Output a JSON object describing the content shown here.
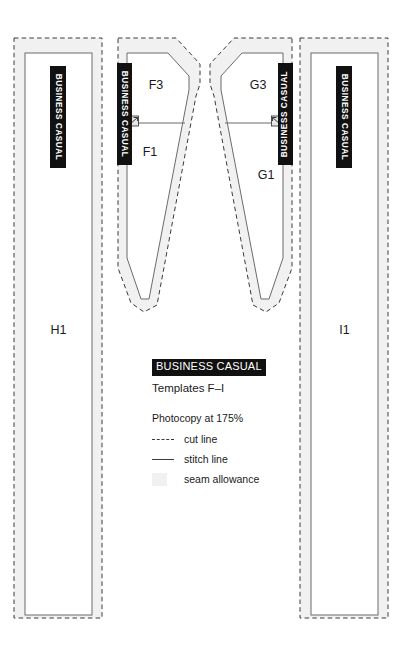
{
  "document": {
    "kind": "sewing-pattern-template-sheet",
    "brand_tag": "BUSINESS CASUAL"
  },
  "legend": {
    "title": "BUSINESS CASUAL",
    "subtitle": "Templates F–I",
    "scale_note": "Photocopy at 175%",
    "entries": [
      {
        "key": "dashed",
        "label": "cut line"
      },
      {
        "key": "solid",
        "label": "stitch line"
      },
      {
        "key": "swatch",
        "label": "seam allowance"
      }
    ]
  },
  "colors": {
    "ink": "#1a1a1a",
    "tag_background": "#111111",
    "tag_text": "#ffffff",
    "cut_line": "#3a3a3a",
    "stitch_line": "#6b6b6b",
    "seam_allowance": "#f1f1f1",
    "paper": "#ffffff"
  },
  "pieces": [
    {
      "id": "H1",
      "code": "H1",
      "shape": "long-rectangular-panel",
      "tag": "BUSINESS CASUAL",
      "tag_side": "center"
    },
    {
      "id": "F3",
      "code": "F3",
      "shape": "angled-yoke",
      "tag": "BUSINESS CASUAL",
      "tag_side": "left"
    },
    {
      "id": "F1",
      "code": "F1",
      "shape": "tapered-panel",
      "tag": null,
      "tag_side": null
    },
    {
      "id": "G3",
      "code": "G3",
      "shape": "angled-yoke",
      "tag": "BUSINESS CASUAL",
      "tag_side": "right"
    },
    {
      "id": "G1",
      "code": "G1",
      "shape": "tapered-panel",
      "tag": null,
      "tag_side": null
    },
    {
      "id": "I1",
      "code": "I1",
      "shape": "long-rectangular-panel",
      "tag": "BUSINESS CASUAL",
      "tag_side": "center"
    }
  ],
  "markings": {
    "notch_f": "seam-notch",
    "notch_g": "seam-notch"
  }
}
